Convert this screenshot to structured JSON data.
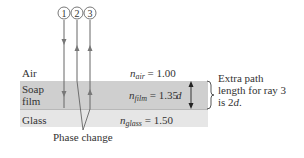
{
  "diagram": {
    "rays": [
      {
        "id": "1",
        "label": "1",
        "direction": "down-then-down"
      },
      {
        "id": "2",
        "label": "2",
        "direction": "up"
      },
      {
        "id": "3",
        "label": "3",
        "direction": "up"
      }
    ],
    "layers": [
      {
        "name": "Air",
        "index_symbol": "n",
        "index_sub": "air",
        "index_value": "= 1.00",
        "color": "#ffffff"
      },
      {
        "name_line1": "Soap",
        "name_line2": "film",
        "index_symbol": "n",
        "index_sub": "film",
        "index_value": "= 1.35",
        "color": "#cfcfcf"
      },
      {
        "name": "Glass",
        "index_symbol": "n",
        "index_sub": "glass",
        "index_value": "= 1.50",
        "color": "#e6e6e6"
      }
    ],
    "thickness_label": "d",
    "annotation": {
      "line1": "Extra path",
      "line2": "length for ray 3",
      "line3_prefix": "is 2",
      "line3_var": "d",
      "line3_suffix": "."
    },
    "phase_change_label": "Phase change"
  }
}
